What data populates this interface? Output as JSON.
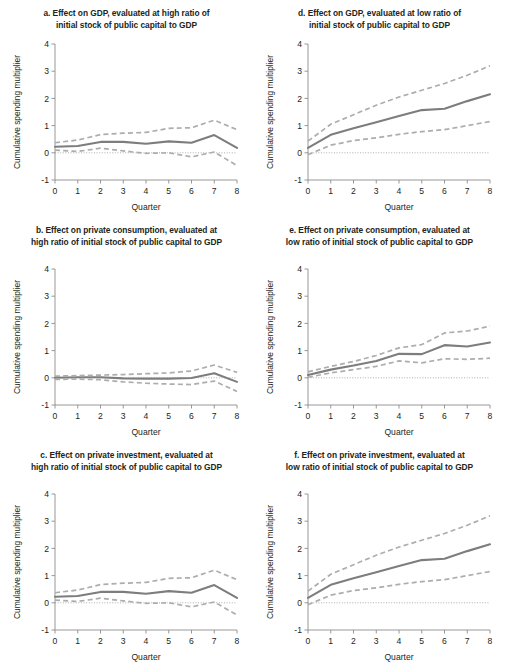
{
  "figure": {
    "name": "cumulative-spending-multiplier-panels",
    "panel_count": 6,
    "colors": {
      "mean_line": "#7d7d7d",
      "band_line": "#adadad",
      "axis": "#8c8c8c",
      "text": "#231f20",
      "background": "#ffffff"
    }
  },
  "axes_common": {
    "xlabel": "Quarter",
    "ylabel": "Cumulative spending multiplier",
    "xticks": [
      "0",
      "1",
      "2",
      "3",
      "4",
      "5",
      "6",
      "7",
      "8"
    ],
    "yticks": [
      "-1",
      "0",
      "1",
      "2",
      "3",
      "4"
    ],
    "xlim": [
      0,
      8
    ],
    "ylim": [
      -1,
      4
    ],
    "grid": false,
    "legend": "none"
  },
  "chart_data": [
    {
      "id": "panel-a",
      "type": "line",
      "title": "a. Effect on GDP, evaluated at high ratio of initial stock of public capital to GDP",
      "title_line1": "a. Effect on GDP, evaluated at high ratio of",
      "title_line2": "initial stock of public capital to GDP",
      "xlabel": "Quarter",
      "ylabel": "Cumulative spending multiplier",
      "x": [
        0,
        1,
        2,
        3,
        4,
        5,
        6,
        7,
        8
      ],
      "xlim": [
        0,
        8
      ],
      "ylim": [
        -1,
        4
      ],
      "series": [
        {
          "name": "Mean",
          "style": "solid",
          "values": [
            0.22,
            0.25,
            0.4,
            0.4,
            0.33,
            0.42,
            0.37,
            0.65,
            0.18
          ]
        },
        {
          "name": "Upper confidence band",
          "style": "dashed",
          "values": [
            0.37,
            0.47,
            0.67,
            0.72,
            0.75,
            0.9,
            0.92,
            1.2,
            0.85
          ]
        },
        {
          "name": "Lower confidence band",
          "style": "dashed",
          "values": [
            0.1,
            0.05,
            0.17,
            0.07,
            -0.02,
            0.0,
            -0.15,
            0.03,
            -0.47
          ]
        }
      ]
    },
    {
      "id": "panel-d",
      "type": "line",
      "title": "d. Effect on GDP, evaluated at low ratio of initial stock of public capital to GDP",
      "title_line1": "d. Effect on GDP, evaluated at low ratio of",
      "title_line2": "initial stock of public capital to GDP",
      "xlabel": "Quarter",
      "ylabel": "Cumulative spending multiplier",
      "x": [
        0,
        1,
        2,
        3,
        4,
        5,
        6,
        7,
        8
      ],
      "xlim": [
        0,
        8
      ],
      "ylim": [
        -1,
        4
      ],
      "series": [
        {
          "name": "Mean",
          "style": "solid",
          "values": [
            0.18,
            0.66,
            0.9,
            1.12,
            1.35,
            1.57,
            1.62,
            1.9,
            2.15
          ]
        },
        {
          "name": "Upper confidence band",
          "style": "dashed",
          "values": [
            0.43,
            1.05,
            1.4,
            1.75,
            2.05,
            2.3,
            2.55,
            2.85,
            3.2
          ]
        },
        {
          "name": "Lower confidence band",
          "style": "dashed",
          "values": [
            -0.07,
            0.28,
            0.45,
            0.55,
            0.68,
            0.78,
            0.85,
            1.0,
            1.15
          ]
        }
      ]
    },
    {
      "id": "panel-b",
      "type": "line",
      "title": "b. Effect on private consumption, evaluated at high ratio of initial stock of public capital to GDP",
      "title_line1": "b. Effect on private consumption, evaluated at",
      "title_line2": "high ratio of initial stock of public capital to GDP",
      "xlabel": "Quarter",
      "ylabel": "Cumulative spending multiplier",
      "x": [
        0,
        1,
        2,
        3,
        4,
        5,
        6,
        7,
        8
      ],
      "xlim": [
        0,
        8
      ],
      "ylim": [
        -1,
        4
      ],
      "series": [
        {
          "name": "Mean",
          "style": "solid",
          "values": [
            0.0,
            0.02,
            0.02,
            -0.02,
            -0.03,
            -0.03,
            -0.01,
            0.17,
            -0.15
          ]
        },
        {
          "name": "Upper confidence band",
          "style": "dashed",
          "values": [
            0.06,
            0.08,
            0.1,
            0.12,
            0.15,
            0.18,
            0.25,
            0.47,
            0.2
          ]
        },
        {
          "name": "Lower confidence band",
          "style": "dashed",
          "values": [
            -0.06,
            -0.05,
            -0.07,
            -0.15,
            -0.2,
            -0.23,
            -0.25,
            -0.12,
            -0.5
          ]
        }
      ]
    },
    {
      "id": "panel-e",
      "type": "line",
      "title": "e. Effect on private consumption, evaluated at low ratio of initial stock of public capital to GDP",
      "title_line1": "e. Effect on private consumption, evaluated at",
      "title_line2": "low ratio of initial stock of public capital to GDP",
      "xlabel": "Quarter",
      "ylabel": "Cumulative spending multiplier",
      "x": [
        0,
        1,
        2,
        3,
        4,
        5,
        6,
        7,
        8
      ],
      "xlim": [
        0,
        8
      ],
      "ylim": [
        -1,
        4
      ],
      "series": [
        {
          "name": "Mean",
          "style": "solid",
          "values": [
            0.1,
            0.3,
            0.45,
            0.62,
            0.88,
            0.87,
            1.2,
            1.15,
            1.3
          ]
        },
        {
          "name": "Upper confidence band",
          "style": "dashed",
          "values": [
            0.22,
            0.42,
            0.6,
            0.82,
            1.1,
            1.22,
            1.65,
            1.72,
            1.9
          ]
        },
        {
          "name": "Lower confidence band",
          "style": "dashed",
          "values": [
            0.02,
            0.18,
            0.3,
            0.42,
            0.62,
            0.55,
            0.7,
            0.68,
            0.72
          ]
        }
      ]
    },
    {
      "id": "panel-c",
      "type": "line",
      "title": "c. Effect on private investment, evaluated at high ratio of initial stock of public capital to GDP",
      "title_line1": "c. Effect on private investment, evaluated at",
      "title_line2": "high ratio of initial stock of public capital to GDP",
      "xlabel": "Quarter",
      "ylabel": "Cumulative spending multiplier",
      "x": [
        0,
        1,
        2,
        3,
        4,
        5,
        6,
        7,
        8
      ],
      "xlim": [
        0,
        8
      ],
      "ylim": [
        -1,
        4
      ],
      "series": [
        {
          "name": "Mean",
          "style": "solid",
          "values": [
            0.22,
            0.25,
            0.4,
            0.4,
            0.33,
            0.43,
            0.37,
            0.65,
            0.18
          ]
        },
        {
          "name": "Upper confidence band",
          "style": "dashed",
          "values": [
            0.37,
            0.47,
            0.67,
            0.72,
            0.75,
            0.9,
            0.92,
            1.2,
            0.85
          ]
        },
        {
          "name": "Lower confidence band",
          "style": "dashed",
          "values": [
            0.1,
            0.05,
            0.17,
            0.07,
            -0.02,
            0.0,
            -0.15,
            0.03,
            -0.45
          ]
        }
      ]
    },
    {
      "id": "panel-f",
      "type": "line",
      "title": "f. Effect on private investment, evaluated at low ratio of initial stock of public capital to GDP",
      "title_line1": "f. Effect on private investment, evaluated at",
      "title_line2": "low ratio of initial stock of public capital to GDP",
      "xlabel": "Quarter",
      "ylabel": "Cumulative spending multiplier",
      "x": [
        0,
        1,
        2,
        3,
        4,
        5,
        6,
        7,
        8
      ],
      "xlim": [
        0,
        8
      ],
      "ylim": [
        -1,
        4
      ],
      "series": [
        {
          "name": "Mean",
          "style": "solid",
          "values": [
            0.18,
            0.66,
            0.9,
            1.12,
            1.35,
            1.57,
            1.62,
            1.9,
            2.15
          ]
        },
        {
          "name": "Upper confidence band",
          "style": "dashed",
          "values": [
            0.43,
            1.05,
            1.4,
            1.75,
            2.05,
            2.3,
            2.55,
            2.85,
            3.2
          ]
        },
        {
          "name": "Lower confidence band",
          "style": "dashed",
          "values": [
            -0.07,
            0.28,
            0.45,
            0.55,
            0.68,
            0.78,
            0.85,
            1.0,
            1.15
          ]
        }
      ]
    }
  ]
}
